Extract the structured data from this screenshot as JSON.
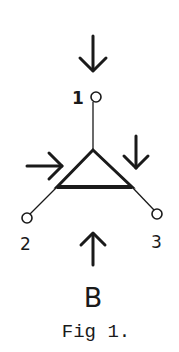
{
  "figure": {
    "caption": "Fig 1.",
    "component_label": "B",
    "nodes": [
      {
        "id": "1",
        "label": "1"
      },
      {
        "id": "2",
        "label": "2"
      },
      {
        "id": "3",
        "label": "3"
      }
    ],
    "arrows": [
      {
        "name": "top-arrow",
        "direction": "down"
      },
      {
        "name": "left-arrow",
        "direction": "right"
      },
      {
        "name": "right-arrow",
        "direction": "down"
      },
      {
        "name": "bottom-arrow",
        "direction": "up"
      }
    ],
    "colors": {
      "ink": "#1a1a1a",
      "background": "#ffffff"
    }
  }
}
